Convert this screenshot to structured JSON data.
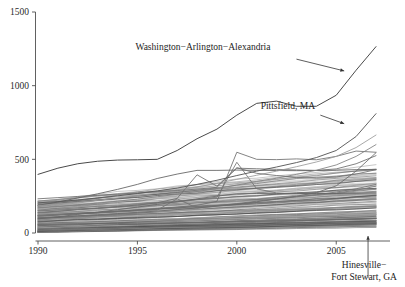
{
  "chart_data": {
    "type": "line",
    "title": "",
    "subtitle": "",
    "xlabel": "",
    "ylabel": "",
    "xlim": [
      1990,
      2007
    ],
    "ylim": [
      0,
      1500
    ],
    "grid": false,
    "legend_position": "none",
    "x_ticks": [
      "1990",
      "1995",
      "2000",
      "2005"
    ],
    "x_tick_values": [
      1990,
      1995,
      2000,
      2005
    ],
    "y_ticks": [
      "0",
      "500",
      "1000",
      "1500"
    ],
    "y_tick_values": [
      0,
      500,
      1000,
      1500
    ],
    "x": [
      1990,
      1991,
      1992,
      1993,
      1994,
      1995,
      1996,
      1997,
      1998,
      1999,
      2000,
      2001,
      2002,
      2003,
      2004,
      2005,
      2006,
      2007
    ],
    "annotations": [
      {
        "name": "washington-arlington-alexandria",
        "text": "Washington−Arlington−Alexandria",
        "label_x": 1994.9,
        "label_y": 1245,
        "arrow_from": [
          2003.0,
          1180
        ],
        "arrow_to": [
          2005.4,
          1100
        ]
      },
      {
        "name": "pittsfield-ma",
        "text": "Pittsfield, MA",
        "label_x": 2001.2,
        "label_y": 840,
        "arrow_from": [
          2004.2,
          800
        ],
        "arrow_to": [
          2005.4,
          742
        ]
      },
      {
        "name": "hinesville-fort-stewart-ga",
        "text": "Hinesville−\nFort Stewart, GA",
        "text_line1": "Hinesville−",
        "text_line2": "Fort Stewart, GA",
        "arrow_from": [
          2006.6,
          -330
        ],
        "arrow_to": [
          2006.6,
          25
        ]
      }
    ],
    "highlighted_series": [
      {
        "name": "Washington−Arlington−Alexandria",
        "color": "#4a4a4a",
        "width": 1.0,
        "values": [
          398,
          440,
          470,
          487,
          495,
          497,
          500,
          560,
          640,
          705,
          800,
          880,
          895,
          860,
          860,
          935,
          1105,
          1265
        ]
      },
      {
        "name": "Pittsfield, MA",
        "color": "#5a5a5a",
        "width": 0.95,
        "values": [
          205,
          213,
          224,
          238,
          252,
          268,
          286,
          305,
          330,
          358,
          390,
          420,
          448,
          478,
          512,
          560,
          655,
          810
        ]
      },
      {
        "name": "Hinesville−Fort Stewart, GA",
        "color": "#6a6a6a",
        "width": 0.9,
        "values": [
          58,
          60,
          62,
          63,
          64,
          66,
          68,
          70,
          72,
          74,
          77,
          79,
          82,
          84,
          87,
          90,
          94,
          99
        ]
      }
    ],
    "spiky_series": [
      {
        "name": "spike-2000-high",
        "color": "#6e6e6e",
        "width": 0.9,
        "values": [
          120,
          126,
          133,
          140,
          148,
          157,
          166,
          176,
          188,
          215,
          548,
          500,
          498,
          503,
          497,
          520,
          556,
          548
        ]
      },
      {
        "name": "spike-2000-mid",
        "color": "#747474",
        "width": 0.9,
        "values": [
          150,
          156,
          163,
          171,
          180,
          190,
          201,
          214,
          228,
          243,
          480,
          300,
          272,
          268,
          265,
          272,
          290,
          318
        ]
      },
      {
        "name": "spike-1998",
        "color": "#6c6c6c",
        "width": 0.9,
        "values": [
          140,
          148,
          157,
          167,
          178,
          190,
          205,
          235,
          395,
          318,
          440,
          436,
          432,
          428,
          425,
          435,
          470,
          525
        ]
      },
      {
        "name": "spike-1997",
        "color": "#737373",
        "width": 0.9,
        "values": [
          118,
          124,
          130,
          136,
          142,
          149,
          156,
          232,
          170,
          186,
          200,
          216,
          232,
          246,
          260,
          278,
          300,
          330
        ]
      },
      {
        "name": "plateau-425",
        "color": "#5f5f5f",
        "width": 0.9,
        "values": [
          188,
          210,
          238,
          266,
          296,
          330,
          370,
          400,
          425,
          425,
          427,
          425,
          424,
          423,
          424,
          426,
          430,
          432
        ]
      },
      {
        "name": "plateau-268",
        "color": "#666666",
        "width": 0.9,
        "values": [
          96,
          110,
          126,
          142,
          158,
          176,
          194,
          212,
          232,
          250,
          266,
          268,
          268,
          268,
          268,
          268,
          270,
          272
        ]
      },
      {
        "name": "late-riser-a",
        "color": "#6a6a6a",
        "width": 0.9,
        "values": [
          104,
          110,
          117,
          124,
          132,
          140,
          149,
          159,
          170,
          182,
          196,
          212,
          230,
          250,
          274,
          320,
          420,
          545
        ]
      },
      {
        "name": "late-riser-b",
        "color": "#9a9a9a",
        "width": 0.9,
        "values": [
          185,
          196,
          209,
          222,
          237,
          253,
          271,
          291,
          313,
          337,
          364,
          392,
          420,
          450,
          482,
          520,
          580,
          665
        ]
      },
      {
        "name": "late-riser-c",
        "color": "#808080",
        "width": 0.9,
        "values": [
          170,
          180,
          191,
          203,
          216,
          230,
          246,
          263,
          282,
          302,
          325,
          350,
          372,
          398,
          426,
          462,
          520,
          600
        ]
      },
      {
        "name": "mid-dip",
        "color": "#6f6f6f",
        "width": 0.9,
        "values": [
          232,
          240,
          248,
          256,
          264,
          272,
          280,
          288,
          298,
          310,
          443,
          405,
          390,
          378,
          372,
          380,
          400,
          430
        ]
      }
    ],
    "band_series_count": 148,
    "band_description": "Dense bundle of remaining metropolitan-area series spanning roughly 0–220 in 1990 and fanning to roughly 20–380 by 2007",
    "band_colors": [
      "#3a3a3a",
      "#555555",
      "#6d6d6d",
      "#8a8a8a",
      "#a5a5a5",
      "#bdbdbd"
    ]
  },
  "axes": {
    "y_axis_name": "y-axis",
    "x_axis_name": "x-axis"
  }
}
